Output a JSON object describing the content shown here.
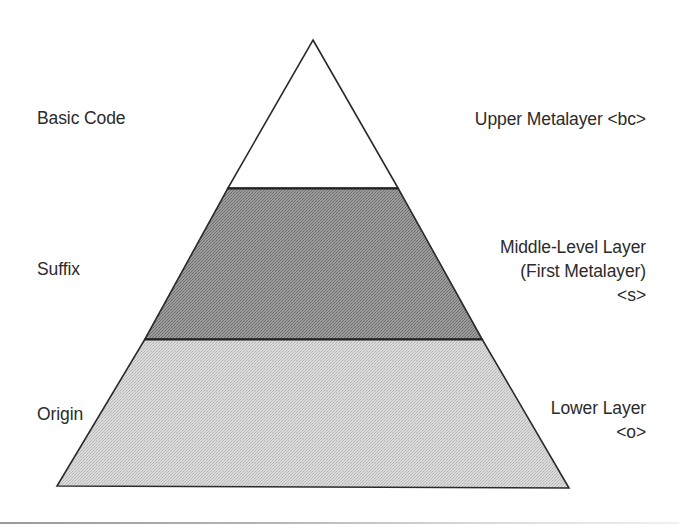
{
  "diagram": {
    "type": "layered-pyramid",
    "layers": [
      {
        "position": "top",
        "left_label": "Basic Code",
        "right_label_lines": [
          "Upper Metalayer <bc>"
        ],
        "fill": "#ffffff"
      },
      {
        "position": "middle",
        "left_label": "Suffix",
        "right_label_lines": [
          "Middle-Level Layer",
          "(First Metalayer)",
          "<s>"
        ],
        "fill": "#8f8f8f"
      },
      {
        "position": "bottom",
        "left_label": "Origin",
        "right_label_lines": [
          "Lower Layer",
          "<o>"
        ],
        "fill": "#d2d2d2"
      }
    ],
    "stroke_color": "#2a2a2a"
  }
}
